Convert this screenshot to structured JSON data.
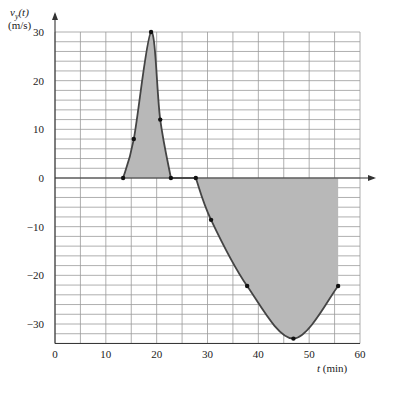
{
  "chart_data": {
    "type": "area",
    "title": "",
    "xlabel": "t (min)",
    "ylabel": "v_y(t)",
    "ylabel_unit": "(m/s)",
    "xlim": [
      0,
      60
    ],
    "ylim": [
      -34,
      30
    ],
    "x_ticks": [
      0,
      10,
      20,
      30,
      40,
      50,
      60
    ],
    "y_ticks": [
      30,
      20,
      10,
      0,
      -10,
      -20,
      -30
    ],
    "grid": {
      "on": true,
      "x_step": 5,
      "y_step": 2
    },
    "legend": null,
    "series": [
      {
        "name": "v_y(t)",
        "marked_points": [
          {
            "t": 13.4,
            "v": 0
          },
          {
            "t": 15.5,
            "v": 8
          },
          {
            "t": 18.9,
            "v": 30
          },
          {
            "t": 20.7,
            "v": 12
          },
          {
            "t": 22.8,
            "v": 0
          },
          {
            "t": 27.7,
            "v": 0
          },
          {
            "t": 30.7,
            "v": -8.6
          },
          {
            "t": 37.8,
            "v": -22.2
          },
          {
            "t": 46.9,
            "v": -33
          },
          {
            "t": 55.7,
            "v": -22.2
          }
        ],
        "shaded_regions": [
          {
            "from_t": 13.4,
            "to_t": 22.8,
            "sign": "positive"
          },
          {
            "from_t": 27.7,
            "to_t": 55.7,
            "sign": "negative"
          }
        ]
      }
    ],
    "colors": {
      "curve": "#444444",
      "fill": "#b8b8b8",
      "grid": "#9a9a9a",
      "axis": "#333333"
    }
  },
  "labels": {
    "y_var": "v",
    "y_sub": "y",
    "y_arg": "(t)",
    "y_unit": "(m/s)",
    "x_var": "t",
    "x_unit": "(min)"
  }
}
